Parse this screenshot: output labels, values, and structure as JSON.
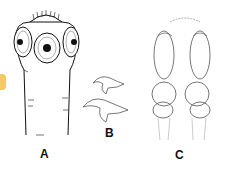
{
  "figure": {
    "panels": [
      {
        "id": "A",
        "label": "A",
        "description": "scolex with four suckers and rostellum"
      },
      {
        "id": "B",
        "label": "B",
        "description": "two rostellar hooks"
      },
      {
        "id": "C",
        "label": "C",
        "description": "paired elongated suckers / bothria structure"
      }
    ],
    "colors": {
      "ink": "#111111",
      "light_ink": "#888888",
      "accent": "#f2c14e",
      "background": "#ffffff"
    }
  }
}
